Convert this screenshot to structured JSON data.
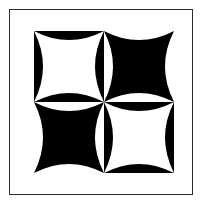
{
  "figure": {
    "canvas": {
      "width": 201,
      "height": 203,
      "background_color": "#ffffff"
    },
    "frame": {
      "name": "outer border rectangle",
      "x": 9,
      "y": 9,
      "width": 184,
      "height": 186,
      "stroke_color": "#2b2b2b",
      "stroke_width": 1,
      "fill_color": "#ffffff"
    },
    "artwork": {
      "x": 33,
      "y": 30,
      "width": 140,
      "height": 142,
      "grid_rows": 2,
      "grid_cols": 2,
      "cell_width": 70,
      "cell_height": 71,
      "shape": "concave-sided square (astroid) cut by four circular arcs",
      "arc_radius": 35,
      "ink_color": "#000000",
      "paper_color": "#ffffff",
      "pattern": "checkerboard inversion",
      "center_motif": "four-point pinwheel",
      "quadrants": [
        {
          "name": "top-left",
          "position": "top-left",
          "background_color": "#000000",
          "shape_color": "#ffffff",
          "inverted": false
        },
        {
          "name": "top-right",
          "position": "top-right",
          "background_color": "#ffffff",
          "shape_color": "#000000",
          "inverted": true
        },
        {
          "name": "bottom-left",
          "position": "bottom-left",
          "background_color": "#ffffff",
          "shape_color": "#000000",
          "inverted": true
        },
        {
          "name": "bottom-right",
          "position": "bottom-right",
          "background_color": "#000000",
          "shape_color": "#ffffff",
          "inverted": false
        }
      ]
    }
  }
}
